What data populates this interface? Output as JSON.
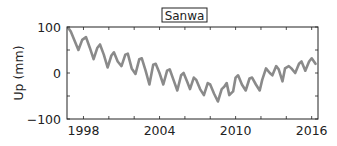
{
  "chart_data": {
    "type": "line",
    "title": "Sanwa",
    "xlabel": "",
    "ylabel": "Up (mm)",
    "xlim": [
      1996.7,
      2016.5
    ],
    "ylim": [
      -100,
      100
    ],
    "x_ticks": [
      1998,
      2004,
      2010,
      2016
    ],
    "x_minor_tick_step": 2,
    "y_ticks": [
      100,
      0,
      -100
    ],
    "y_minor_tick_step": 50,
    "grid": false,
    "legend": null,
    "line_color": "#8a8a8a",
    "series": [
      {
        "name": "Sanwa Up",
        "x": [
          1996.8,
          1997.0,
          1997.3,
          1997.6,
          1997.9,
          1998.2,
          1998.5,
          1998.8,
          1999.1,
          1999.3,
          1999.6,
          1999.9,
          2000.2,
          2000.4,
          2000.7,
          2001.0,
          2001.3,
          2001.5,
          2001.8,
          2002.1,
          2002.4,
          2002.6,
          2002.9,
          2003.2,
          2003.5,
          2003.7,
          2004.0,
          2004.3,
          2004.6,
          2004.8,
          2005.1,
          2005.4,
          2005.7,
          2005.9,
          2006.2,
          2006.4,
          2006.7,
          2006.9,
          2007.2,
          2007.5,
          2007.8,
          2008.0,
          2008.3,
          2008.6,
          2008.9,
          2009.1,
          2009.3,
          2009.5,
          2009.8,
          2010.0,
          2010.2,
          2010.5,
          2010.8,
          2011.1,
          2011.3,
          2011.6,
          2011.9,
          2012.1,
          2012.4,
          2012.7,
          2012.9,
          2013.2,
          2013.4,
          2013.7,
          2013.9,
          2014.2,
          2014.4,
          2014.7,
          2015.0,
          2015.2,
          2015.5,
          2015.8,
          2016.0,
          2016.3
        ],
        "values": [
          98,
          90,
          70,
          50,
          72,
          78,
          55,
          30,
          55,
          62,
          40,
          12,
          38,
          45,
          25,
          15,
          40,
          42,
          10,
          -2,
          30,
          32,
          5,
          -25,
          18,
          20,
          0,
          -25,
          5,
          8,
          -15,
          -38,
          -5,
          0,
          -20,
          -35,
          -10,
          -15,
          -35,
          -48,
          -22,
          -25,
          -45,
          -62,
          -35,
          -30,
          -22,
          -48,
          -40,
          -10,
          -5,
          -25,
          -38,
          -12,
          -10,
          -25,
          -38,
          -15,
          10,
          0,
          -5,
          15,
          8,
          -18,
          10,
          15,
          10,
          0,
          20,
          25,
          5,
          25,
          32,
          20
        ]
      }
    ]
  }
}
